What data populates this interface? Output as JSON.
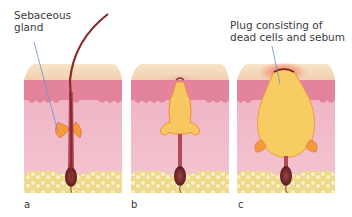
{
  "figure": {
    "annotations": {
      "sebaceous_gland": [
        "Sebaceous",
        "gland"
      ],
      "plug": [
        "Plug consisting of",
        "dead cells and sebum"
      ]
    },
    "panels": [
      {
        "letter": "a",
        "stage": "normal hair follicle with sebaceous gland"
      },
      {
        "letter": "b",
        "stage": "follicle filling with sebum"
      },
      {
        "letter": "c",
        "stage": "enlarged follicle plugged with dead cells and sebum"
      }
    ],
    "colors": {
      "epidermis_top": "#f6dcc0",
      "epidermis_layer": "#e88aa0",
      "dermis": "#f2bccb",
      "fat": "#f3e3a0",
      "sebum": "#f7c861",
      "gland": "#f59a3a",
      "hair": "#8a2a2a",
      "pointer_line": "#6a8fd6",
      "inflammation": "#f06a4a"
    }
  }
}
